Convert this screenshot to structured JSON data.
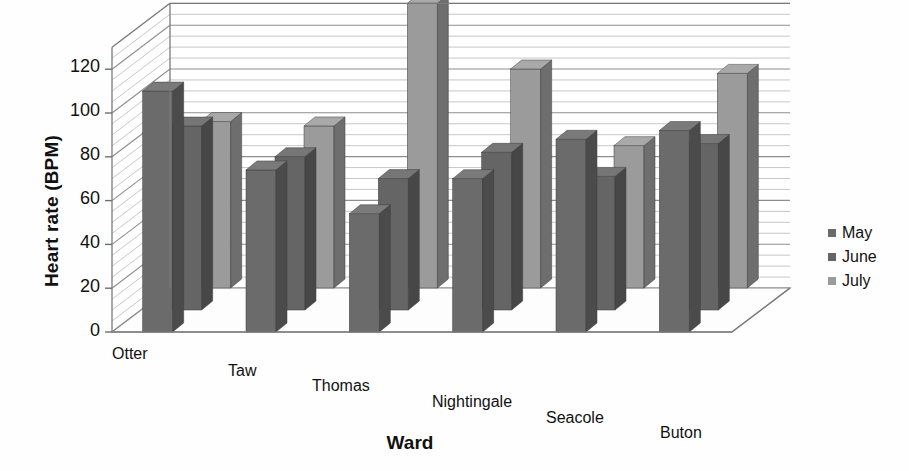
{
  "chart_data": {
    "type": "bar",
    "title": "",
    "subtitle": "",
    "xlabel": "Ward",
    "ylabel": "Heart rate (BPM)",
    "categories": [
      "Otter",
      "Taw",
      "Thomas",
      "Nightingale",
      "Seacole",
      "Buton"
    ],
    "series": [
      {
        "name": "May",
        "values": [
          110,
          74,
          54,
          70,
          88,
          92
        ]
      },
      {
        "name": "June",
        "values": [
          84,
          70,
          60,
          72,
          61,
          76
        ]
      },
      {
        "name": "July",
        "values": [
          76,
          74,
          130,
          100,
          65,
          98
        ]
      }
    ],
    "ylim": [
      0,
      130
    ],
    "yticks": [
      0,
      20,
      40,
      60,
      80,
      100,
      120
    ],
    "ytick_labels": [
      "0",
      "20",
      "40",
      "60",
      "80",
      "100",
      "120"
    ],
    "grid": true,
    "grid_style": "horizontal-wall-lines",
    "legend_position": "right",
    "three_d": true,
    "colors": {
      "may": "#6b6b6b",
      "june": "#656565",
      "july": "#9b9b9b",
      "may_side": "#4b4b4b",
      "june_side": "#474747",
      "july_side": "#6e6e6e",
      "may_top": "#7a7a7a",
      "june_top": "#767676",
      "july_top": "#a9a9a9",
      "wall": "#b9b9b9",
      "axis": "#7a7a7a",
      "text": "#111111",
      "background": "#fefefe"
    }
  },
  "legend": {
    "items": [
      {
        "label": "May",
        "color": "#6b6b6b"
      },
      {
        "label": "June",
        "color": "#656565"
      },
      {
        "label": "July",
        "color": "#9b9b9b"
      }
    ]
  },
  "axes": {
    "y_title": "Heart rate (BPM)",
    "x_title": "Ward",
    "y_tick_labels": [
      "120",
      "100",
      "80",
      "60",
      "40",
      "20",
      "0"
    ],
    "x_tick_labels": [
      "Otter",
      "Taw",
      "Thomas",
      "Nightingale",
      "Seacole",
      "Buton"
    ]
  }
}
